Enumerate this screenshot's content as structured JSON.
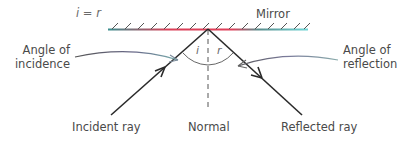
{
  "diagram": {
    "equation": "i = r",
    "labels": {
      "mirror": "Mirror",
      "angle_incidence_line1": "Angle of",
      "angle_incidence_line2": "incidence",
      "angle_reflection_line1": "Angle of",
      "angle_reflection_line2": "reflection",
      "incident_ray": "Incident ray",
      "normal": "Normal",
      "reflected_ray": "Reflected ray",
      "angle_i": "i",
      "angle_r": "r"
    },
    "colors": {
      "mirror_edge": "#3a9c9c",
      "mirror_center": "#e0405a",
      "mirror_right": "#5fd0d0",
      "ray": "#333333",
      "text": "#4a4a4a",
      "normal": "#555555",
      "arc": "#666666"
    }
  }
}
